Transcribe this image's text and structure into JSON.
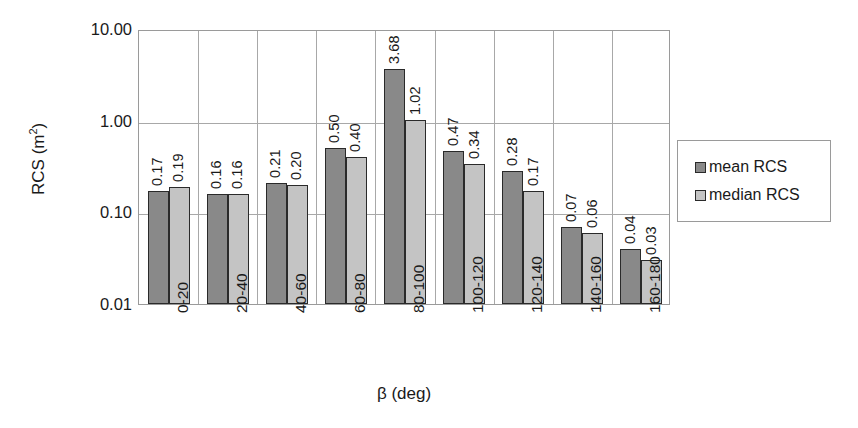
{
  "chart_data": {
    "type": "bar",
    "title": "",
    "xlabel": "β (deg)",
    "ylabel": "RCS (m²)",
    "yscale": "log",
    "ylim": [
      0.01,
      10.0
    ],
    "ytick_labels": [
      "10.00",
      "1.00",
      "0.10",
      "0.01"
    ],
    "ytick_values": [
      10.0,
      1.0,
      0.1,
      0.01
    ],
    "grid": "horizontal-and-vertical",
    "legend_position": "right",
    "categories": [
      "0-20",
      "20-40",
      "40-60",
      "60-80",
      "80-100",
      "100-120",
      "120-140",
      "140-160",
      "160-180"
    ],
    "series": [
      {
        "name": "mean RCS",
        "color": "#898989",
        "values": [
          0.17,
          0.16,
          0.21,
          0.5,
          3.68,
          0.47,
          0.28,
          0.07,
          0.04
        ],
        "labels": [
          "0.17",
          "0.16",
          "0.21",
          "0.50",
          "3.68",
          "0.47",
          "0.28",
          "0.07",
          "0.04"
        ]
      },
      {
        "name": "median RCS",
        "color": "#c4c4c4",
        "values": [
          0.19,
          0.16,
          0.2,
          0.4,
          1.02,
          0.34,
          0.17,
          0.06,
          0.03
        ],
        "labels": [
          "0.19",
          "0.16",
          "0.20",
          "0.40",
          "1.02",
          "0.34",
          "0.17",
          "0.06",
          "0.03"
        ]
      }
    ]
  },
  "axis": {
    "y_title_main": "RCS (m",
    "y_title_sup": "2",
    "y_title_close": ")",
    "x_title": "β (deg)"
  },
  "legend": {
    "items": [
      {
        "label": "mean RCS",
        "swatch": "mean"
      },
      {
        "label": "median RCS",
        "swatch": "median"
      }
    ]
  }
}
